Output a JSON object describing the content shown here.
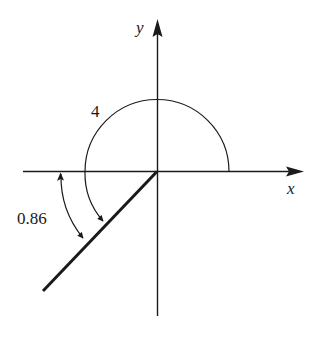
{
  "diagram": {
    "type": "angle-diagram",
    "axes": {
      "x_label": "x",
      "y_label": "y"
    },
    "angles": {
      "large_angle_label": "4",
      "small_angle_label": "0.86"
    },
    "colors": {
      "ink": "#1a1a1a",
      "background": "#ffffff"
    }
  }
}
